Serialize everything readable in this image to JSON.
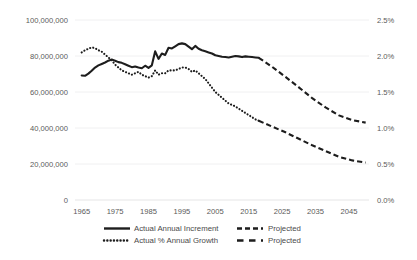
{
  "chart_data": {
    "type": "line",
    "title": "",
    "xlabel": "",
    "ylabel": "",
    "grid": true,
    "legend_position": "bottom",
    "x": [
      1965,
      1970,
      1975,
      1980,
      1985,
      1990,
      1995,
      2000,
      2005,
      2010,
      2015,
      2020,
      2025,
      2030,
      2035,
      2040,
      2045,
      2050
    ],
    "xlim": [
      1963,
      2051
    ],
    "xticks": [
      "1965",
      "1975",
      "1985",
      "1995",
      "2005",
      "2015",
      "2025",
      "2035",
      "2045"
    ],
    "xtick_values": [
      1965,
      1975,
      1985,
      1995,
      2005,
      2015,
      2025,
      2035,
      2045
    ],
    "left_axis": {
      "ylim": [
        0,
        100000000
      ],
      "ticks": [
        "0",
        "20,000,000",
        "40,000,000",
        "60,000,000",
        "80,000,000",
        "100,000,000"
      ],
      "tick_values": [
        0,
        20000000,
        40000000,
        60000000,
        80000000,
        100000000
      ]
    },
    "right_axis": {
      "ylim": [
        0.0,
        2.5
      ],
      "ticks": [
        "0.0%",
        "0.5%",
        "1.0%",
        "1.5%",
        "2.0%",
        "2.5%"
      ],
      "tick_values": [
        0.0,
        0.5,
        1.0,
        1.5,
        2.0,
        2.5
      ],
      "unit": "%"
    },
    "series": [
      {
        "name": "Actual Annual Increment",
        "axis": "left",
        "style": "solid",
        "color": "#1d1d1d",
        "points": [
          [
            1965,
            69200000
          ],
          [
            1966,
            69000000
          ],
          [
            1967,
            70200000
          ],
          [
            1968,
            71800000
          ],
          [
            1969,
            73600000
          ],
          [
            1970,
            74800000
          ],
          [
            1971,
            75600000
          ],
          [
            1972,
            76400000
          ],
          [
            1973,
            77400000
          ],
          [
            1974,
            78000000
          ],
          [
            1975,
            77400000
          ],
          [
            1976,
            76600000
          ],
          [
            1977,
            76200000
          ],
          [
            1978,
            75400000
          ],
          [
            1979,
            74600000
          ],
          [
            1980,
            73800000
          ],
          [
            1981,
            74200000
          ],
          [
            1982,
            73600000
          ],
          [
            1983,
            73200000
          ],
          [
            1984,
            74600000
          ],
          [
            1985,
            73400000
          ],
          [
            1986,
            74800000
          ],
          [
            1987,
            82600000
          ],
          [
            1988,
            78400000
          ],
          [
            1989,
            81400000
          ],
          [
            1990,
            80600000
          ],
          [
            1991,
            84600000
          ],
          [
            1992,
            84200000
          ],
          [
            1993,
            85400000
          ],
          [
            1994,
            86600000
          ],
          [
            1995,
            87000000
          ],
          [
            1996,
            86600000
          ],
          [
            1997,
            85200000
          ],
          [
            1998,
            83800000
          ],
          [
            1999,
            85600000
          ],
          [
            2000,
            84000000
          ],
          [
            2001,
            83200000
          ],
          [
            2002,
            82600000
          ],
          [
            2003,
            82000000
          ],
          [
            2004,
            81400000
          ],
          [
            2005,
            80400000
          ],
          [
            2006,
            80000000
          ],
          [
            2007,
            79600000
          ],
          [
            2008,
            79400000
          ],
          [
            2009,
            79200000
          ],
          [
            2010,
            79600000
          ],
          [
            2011,
            80000000
          ],
          [
            2012,
            79800000
          ],
          [
            2013,
            79400000
          ],
          [
            2014,
            79800000
          ],
          [
            2015,
            79600000
          ],
          [
            2016,
            79400000
          ],
          [
            2017,
            79200000
          ],
          [
            2018,
            79000000
          ]
        ]
      },
      {
        "name": "Projected Annual Increment",
        "axis": "left",
        "style": "dashed",
        "color": "#1d1d1d",
        "points": [
          [
            2018,
            79000000
          ],
          [
            2022,
            74000000
          ],
          [
            2026,
            68400000
          ],
          [
            2030,
            62600000
          ],
          [
            2034,
            56600000
          ],
          [
            2038,
            51400000
          ],
          [
            2042,
            47000000
          ],
          [
            2046,
            44400000
          ],
          [
            2050,
            43000000
          ]
        ]
      },
      {
        "name": "Actual % Annual Growth",
        "axis": "right",
        "style": "dotted",
        "color": "#1d1d1d",
        "points": [
          [
            1965,
            2.05
          ],
          [
            1966,
            2.08
          ],
          [
            1967,
            2.1
          ],
          [
            1968,
            2.12
          ],
          [
            1969,
            2.11
          ],
          [
            1970,
            2.08
          ],
          [
            1971,
            2.06
          ],
          [
            1972,
            2.02
          ],
          [
            1973,
            1.98
          ],
          [
            1974,
            1.94
          ],
          [
            1975,
            1.88
          ],
          [
            1976,
            1.84
          ],
          [
            1977,
            1.8
          ],
          [
            1978,
            1.78
          ],
          [
            1979,
            1.76
          ],
          [
            1980,
            1.74
          ],
          [
            1981,
            1.76
          ],
          [
            1982,
            1.78
          ],
          [
            1983,
            1.74
          ],
          [
            1984,
            1.72
          ],
          [
            1985,
            1.7
          ],
          [
            1986,
            1.72
          ],
          [
            1987,
            1.8
          ],
          [
            1988,
            1.74
          ],
          [
            1989,
            1.76
          ],
          [
            1990,
            1.76
          ],
          [
            1991,
            1.8
          ],
          [
            1992,
            1.8
          ],
          [
            1993,
            1.8
          ],
          [
            1994,
            1.82
          ],
          [
            1995,
            1.84
          ],
          [
            1996,
            1.84
          ],
          [
            1997,
            1.82
          ],
          [
            1998,
            1.78
          ],
          [
            1999,
            1.8
          ],
          [
            2000,
            1.76
          ],
          [
            2001,
            1.72
          ],
          [
            2002,
            1.68
          ],
          [
            2003,
            1.62
          ],
          [
            2004,
            1.56
          ],
          [
            2005,
            1.5
          ],
          [
            2006,
            1.46
          ],
          [
            2007,
            1.42
          ],
          [
            2008,
            1.38
          ],
          [
            2009,
            1.34
          ],
          [
            2010,
            1.32
          ],
          [
            2011,
            1.3
          ],
          [
            2012,
            1.27
          ],
          [
            2013,
            1.24
          ],
          [
            2014,
            1.21
          ],
          [
            2015,
            1.18
          ],
          [
            2016,
            1.15
          ],
          [
            2017,
            1.12
          ],
          [
            2018,
            1.1
          ]
        ]
      },
      {
        "name": "Projected % Annual Growth",
        "axis": "right",
        "style": "dashed",
        "color": "#1d1d1d",
        "points": [
          [
            2018,
            1.1
          ],
          [
            2022,
            1.02
          ],
          [
            2026,
            0.94
          ],
          [
            2030,
            0.85
          ],
          [
            2034,
            0.76
          ],
          [
            2038,
            0.68
          ],
          [
            2042,
            0.6
          ],
          [
            2046,
            0.55
          ],
          [
            2050,
            0.52
          ]
        ]
      }
    ],
    "legend": [
      {
        "label": "Actual Annual Increment",
        "style": "solid"
      },
      {
        "label": "Projected",
        "style": "dashed"
      },
      {
        "label": "Actual % Annual Growth",
        "style": "dotted"
      },
      {
        "label": "Projected",
        "style": "dashed2"
      }
    ]
  }
}
